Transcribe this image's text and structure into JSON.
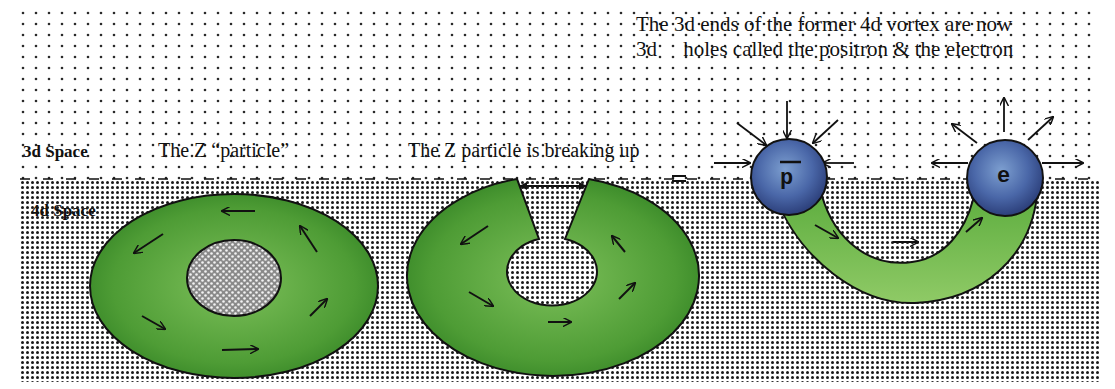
{
  "labels": {
    "space_3d": "3d Space",
    "space_4d": "4d Space",
    "z_particle": "The Z “particle”",
    "z_breaking": "The Z particle is breaking up",
    "caption_line1": "The 3d ends of the former 4d vortex are now",
    "caption_line2": "3d     holes called the positron & the electron"
  },
  "particles": {
    "positron_symbol": "p",
    "electron_symbol": "e"
  },
  "colors": {
    "background": "#ffffff",
    "dot_sparse": "#2a2a2a",
    "dot_dense": "#1a1a1a",
    "vortex_green_light": "#7dc05a",
    "vortex_green_dark": "#2f7f22",
    "sphere_blue_light": "#7d9fd0",
    "sphere_blue_dark": "#2c3f7a",
    "outline": "#111111"
  },
  "regions": {
    "space_3d_top": 10,
    "boundary_y": 180,
    "bottom": 382,
    "left": 20,
    "right": 1100
  }
}
